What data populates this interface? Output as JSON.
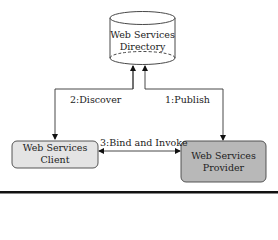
{
  "diagram": {
    "directory": {
      "line1": "Web Services",
      "line2": "Directory"
    },
    "client": {
      "line1": "Web Services",
      "line2": "Client",
      "fill": "#e4e4e4"
    },
    "provider": {
      "line1": "Web Services",
      "line2": "Provider",
      "fill": "#b8b8b8"
    },
    "edges": {
      "discover": "2:Discover",
      "publish": "1:Publish",
      "bind": "3:Bind and Invoke"
    }
  }
}
